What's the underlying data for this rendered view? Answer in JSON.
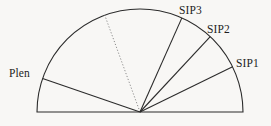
{
  "figure": {
    "background_color": "#f8f7f5",
    "stroke_color": "#2b2b2b",
    "dotted_stroke_color": "#8d8d8d",
    "type": "semicircular-sector-diagram"
  },
  "geometry": {
    "center": {
      "x": 140,
      "y": 112
    },
    "radius": 103,
    "baseline": {
      "x1": 37,
      "y1": 112,
      "x2": 243,
      "y2": 112
    },
    "arc_start_angle_deg": 0,
    "arc_end_angle_deg": 180
  },
  "labels": {
    "plen": "Plen",
    "sip1": "SIP1",
    "sip2": "SIP2",
    "sip3": "SIP3"
  },
  "radials": [
    {
      "name": "plen",
      "label": "Plen",
      "angle_deg": 161,
      "style": "solid"
    },
    {
      "name": "sip3",
      "label": "SIP3",
      "angle_deg": 66,
      "style": "solid"
    },
    {
      "name": "sip2",
      "label": "SIP2",
      "angle_deg": 47,
      "style": "solid"
    },
    {
      "name": "sip1",
      "label": "SIP1",
      "angle_deg": 26,
      "style": "solid"
    },
    {
      "name": "reference",
      "label": "",
      "angle_deg": 110,
      "style": "dotted"
    }
  ]
}
